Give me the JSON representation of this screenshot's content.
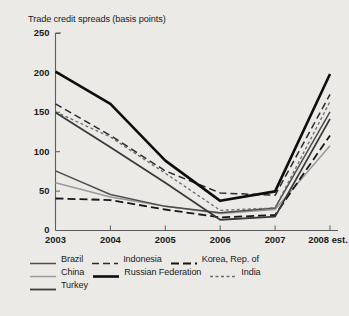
{
  "figure": {
    "background_color": "#eceae7",
    "title": "Trade credit spreads (basis points)"
  },
  "chart_data": {
    "type": "line",
    "title": "Trade credit spreads (basis points)",
    "xlabel": "",
    "ylabel": "basis points",
    "categories": [
      "2003",
      "2004",
      "2005",
      "2006",
      "2007",
      "2008 est."
    ],
    "x_tick_labels": [
      "2003",
      "2004",
      "2005",
      "2006",
      "2007",
      "2008 est."
    ],
    "y_tick_labels": [
      "0",
      "50",
      "100",
      "150",
      "200",
      "250"
    ],
    "y_ticks": [
      0,
      50,
      100,
      150,
      200,
      250
    ],
    "ylim": [
      0,
      250
    ],
    "grid": false,
    "legend_position": "below",
    "series": [
      {
        "name": "Brazil",
        "values": [
          75,
          45,
          30,
          22,
          28,
          150
        ],
        "color": "#4d4d4d",
        "style": "solid",
        "width": 1.5,
        "dasharray": ""
      },
      {
        "name": "Indonesia",
        "values": [
          160,
          120,
          75,
          47,
          44,
          172
        ],
        "color": "#2b2b2b",
        "style": "dashed",
        "width": 1.5,
        "dasharray": "7,4"
      },
      {
        "name": "Korea, Rep. of",
        "values": [
          40,
          38,
          26,
          16,
          19,
          120
        ],
        "color": "#161616",
        "style": "dashed",
        "width": 1.8,
        "dasharray": "8,4"
      },
      {
        "name": "China",
        "values": [
          60,
          42,
          30,
          21,
          26,
          107
        ],
        "color": "#9a9a9a",
        "style": "solid",
        "width": 1.5,
        "dasharray": ""
      },
      {
        "name": "Russian Federation",
        "values": [
          201,
          160,
          88,
          37,
          49,
          198
        ],
        "color": "#0d0d0d",
        "style": "solid",
        "width": 2.6,
        "dasharray": ""
      },
      {
        "name": "India",
        "values": [
          150,
          118,
          72,
          25,
          28,
          163
        ],
        "color": "#6b6b6b",
        "style": "dotted",
        "width": 1.3,
        "dasharray": "3,2.5"
      },
      {
        "name": "Turkey",
        "values": [
          149,
          105,
          60,
          13,
          17,
          141
        ],
        "color": "#3a3a3a",
        "style": "solid",
        "width": 1.8,
        "dasharray": ""
      }
    ]
  },
  "legend": {
    "rows": [
      [
        "Brazil",
        "Indonesia",
        "Korea, Rep. of"
      ],
      [
        "China",
        "Russian Federation",
        "India"
      ],
      [
        "Turkey"
      ]
    ]
  }
}
